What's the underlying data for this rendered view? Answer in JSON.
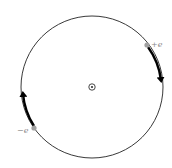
{
  "diagram": {
    "circle": {
      "cx": 92,
      "cy": 87,
      "r": 71,
      "stroke": "#222222"
    },
    "center_symbol": {
      "name": "field-out-of-page",
      "glyph": "⊙"
    },
    "charges": [
      {
        "label": "+e",
        "x": 147,
        "y": 45,
        "color": "#a0a0a0",
        "motion": "clockwise-down"
      },
      {
        "label": "−e",
        "x": 34,
        "y": 128,
        "color": "#a0a0a0",
        "motion": "clockwise-up"
      }
    ],
    "arrow_color": "#000000"
  }
}
